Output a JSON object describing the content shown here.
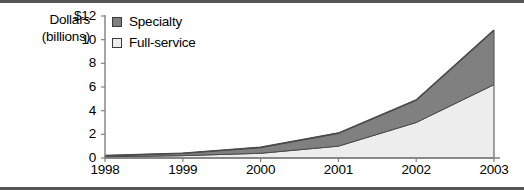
{
  "axis_title": {
    "line1": "Dollars",
    "line2": "(billions)"
  },
  "legend": {
    "position": "top-left-inside",
    "items": [
      {
        "label": "Specialty",
        "color": "#808080",
        "swatch_name": "legend-swatch-specialty"
      },
      {
        "label": "Full-service",
        "color": "#ededed",
        "swatch_name": "legend-swatch-full-service"
      }
    ]
  },
  "yticks": [
    "$12",
    "10",
    "8",
    "6",
    "4",
    "2",
    "0"
  ],
  "xticks": [
    "1998",
    "1999",
    "2000",
    "2001",
    "2002",
    "2003"
  ],
  "colors": {
    "specialty": "#808080",
    "full_service": "#ededed",
    "outline": "#4a4a4a",
    "axis": "#808080",
    "frame": "#555555",
    "text": "#000000"
  },
  "chart_data": {
    "type": "area",
    "stacked": true,
    "title": "",
    "xlabel": "",
    "ylabel": "Dollars (billions)",
    "categories": [
      "1998",
      "1999",
      "2000",
      "2001",
      "2002",
      "2003"
    ],
    "x": [
      1998,
      1999,
      2000,
      2001,
      2002,
      2003
    ],
    "series": [
      {
        "name": "Full-service",
        "color": "#ededed",
        "values": [
          0.1,
          0.2,
          0.4,
          1.0,
          3.0,
          6.2
        ]
      },
      {
        "name": "Specialty",
        "color": "#808080",
        "values": [
          0.1,
          0.2,
          0.5,
          1.1,
          1.9,
          4.6
        ]
      }
    ],
    "cumulative_totals": [
      0.2,
      0.4,
      0.9,
      2.1,
      4.9,
      10.8
    ],
    "ylim": [
      0,
      12
    ],
    "ytick_values": [
      0,
      2,
      4,
      6,
      8,
      10,
      12
    ],
    "grid": false,
    "legend_position": "upper left"
  }
}
